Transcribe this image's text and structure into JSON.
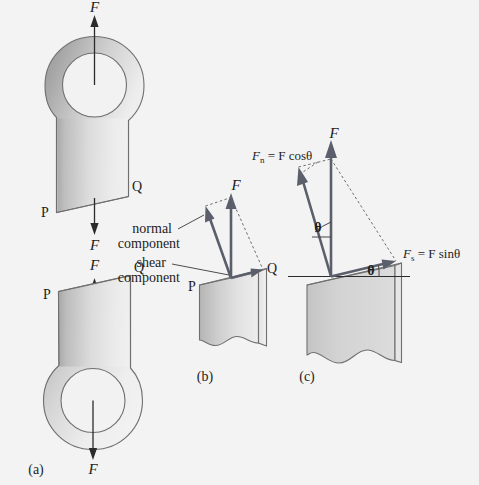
{
  "figure": {
    "background_color": "#f3f3f3",
    "body_fill_light": "#e9e9e9",
    "body_fill_dark": "#b4b4b4",
    "outline_color": "#6f6f6f",
    "vector_color": "#5a5f6b",
    "text_color": "#1d1d1d"
  },
  "panels": {
    "a": {
      "caption": "(a)",
      "force_top": "F",
      "force_mid_upper": "F",
      "force_mid_lower": "F",
      "force_bottom": "F",
      "point_p_top": "P",
      "point_q_top": "Q",
      "point_p_bottom": "P",
      "point_q_bottom": "Q"
    },
    "b": {
      "caption": "(b)",
      "force": "F",
      "normal_label_line1": "normal",
      "normal_label_line2": "component",
      "shear_label_line1": "shear",
      "shear_label_line2": "component",
      "point_p": "P",
      "point_q": "Q"
    },
    "c": {
      "caption": "(c)",
      "force": "F",
      "normal_eq_symbol": "F",
      "normal_eq_subscript": "n",
      "normal_eq_rest": " = F cosθ",
      "shear_eq_symbol": "F",
      "shear_eq_subscript": "s",
      "shear_eq_rest": " = F sinθ",
      "angle_vector": "θ",
      "angle_plane": "θ",
      "point_q": "Q"
    }
  }
}
